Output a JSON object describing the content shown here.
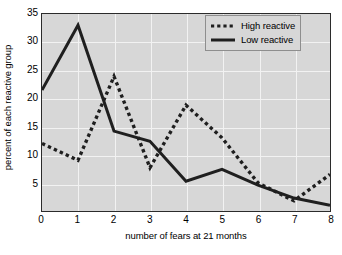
{
  "chart_data": {
    "type": "line",
    "title": "",
    "xlabel": "number of fears at 21 months",
    "ylabel": "percent of each reactive group",
    "x": [
      0,
      1,
      2,
      3,
      4,
      5,
      6,
      7,
      8
    ],
    "xlim": [
      0,
      8
    ],
    "ylim": [
      0,
      35
    ],
    "xticks": [
      "0",
      "1",
      "2",
      "3",
      "4",
      "5",
      "6",
      "7",
      "8"
    ],
    "yticks": [
      "5",
      "10",
      "15",
      "20",
      "25",
      "30",
      "35"
    ],
    "grid": true,
    "legend_position": "top-right",
    "series": [
      {
        "name": "High reactive",
        "style": "dotted",
        "color": "#1f1f1f",
        "values": [
          12.0,
          9.0,
          23.9,
          7.7,
          18.8,
          13.0,
          5.0,
          1.8,
          6.5
        ]
      },
      {
        "name": "Low reactive",
        "style": "solid",
        "color": "#1f1f1f",
        "values": [
          21.5,
          33.0,
          14.2,
          12.4,
          5.3,
          7.4,
          4.6,
          2.3,
          1.0
        ]
      }
    ]
  },
  "legend": {
    "items": [
      {
        "label": "High reactive",
        "style": "dotted"
      },
      {
        "label": "Low reactive",
        "style": "solid"
      }
    ]
  },
  "colors": {
    "plot_background": "#d7d7d7",
    "axis": "#2b2b2b",
    "gridline": "#f2f2f2",
    "line": "#1f1f1f"
  }
}
